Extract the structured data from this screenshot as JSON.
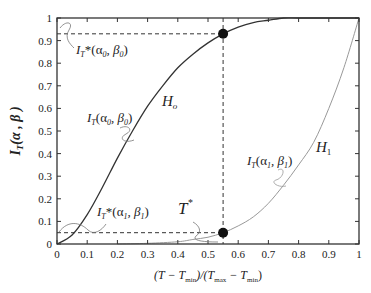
{
  "chart_data": {
    "type": "line",
    "title": "",
    "xlabel": "(T − T_min)/(T_max − T_min)",
    "ylabel": "I_T(α, β)",
    "xlim": [
      0,
      1
    ],
    "ylim": [
      0,
      1
    ],
    "grid": false,
    "legend": "none (inline annotations)",
    "x_ticks": [
      "0",
      "0.1",
      "0.2",
      "0.3",
      "0.4",
      "0.5",
      "0.6",
      "0.7",
      "0.8",
      "0.9",
      "1"
    ],
    "y_ticks": [
      "0",
      "0.1",
      "0.2",
      "0.3",
      "0.4",
      "0.5",
      "0.6",
      "0.7",
      "0.8",
      "0.9",
      "1"
    ],
    "series": [
      {
        "name": "H_o : I_T(α0, β0)",
        "color": "#333333",
        "x": [
          0,
          0.05,
          0.1,
          0.15,
          0.2,
          0.25,
          0.3,
          0.35,
          0.4,
          0.45,
          0.5,
          0.55,
          0.6,
          0.65,
          0.7,
          0.75,
          0.8,
          0.9,
          1.0
        ],
        "y": [
          0,
          0.04,
          0.13,
          0.25,
          0.38,
          0.5,
          0.61,
          0.7,
          0.78,
          0.84,
          0.89,
          0.93,
          0.96,
          0.98,
          0.99,
          1.0,
          1.0,
          1.0,
          1.0
        ]
      },
      {
        "name": "H_1 : I_T(α1, β1)",
        "color": "#999999",
        "x": [
          0.2,
          0.3,
          0.4,
          0.45,
          0.5,
          0.55,
          0.6,
          0.65,
          0.7,
          0.75,
          0.8,
          0.85,
          0.9,
          0.95,
          1.0
        ],
        "y": [
          0,
          0.003,
          0.01,
          0.02,
          0.03,
          0.05,
          0.08,
          0.12,
          0.18,
          0.26,
          0.35,
          0.45,
          0.6,
          0.78,
          1.0
        ]
      }
    ],
    "markers": [
      {
        "x": 0.55,
        "y": 0.93,
        "label": "I_T*(α0, β0)"
      },
      {
        "x": 0.55,
        "y": 0.05,
        "label": "I_T*(α1, β1)"
      }
    ],
    "reference_lines": [
      {
        "type": "horizontal",
        "y": 0.93,
        "x_to": 0.55,
        "style": "dashed"
      },
      {
        "type": "horizontal",
        "y": 0.05,
        "x_to": 0.55,
        "style": "dashed"
      },
      {
        "type": "vertical",
        "x": 0.55,
        "style": "dashed"
      }
    ],
    "annotations": [
      {
        "text": "I_T*(α0, β0)",
        "at": "y=0.93 left"
      },
      {
        "text": "I_T(α0, β0)",
        "at": "H_o curve"
      },
      {
        "text": "H_o",
        "at": "H_o curve near x=0.35"
      },
      {
        "text": "I_T*(α1, β1)",
        "at": "y=0.05 left"
      },
      {
        "text": "T*",
        "at": "x=0.55"
      },
      {
        "text": "I_T(α1, β1)",
        "at": "H_1 curve"
      },
      {
        "text": "H_1",
        "at": "H_1 curve near x=0.8"
      }
    ]
  },
  "labels": {
    "it_star_0_base": "I",
    "it_star_0_sub": "T",
    "it_star_0_args": "*(α",
    "it_star_0_a_sub": "0",
    "it_star_0_mid": ", β",
    "it_star_0_b_sub": "0",
    "it_star_0_close": ")",
    "it_0_base": "I",
    "it_0_sub": "T",
    "it_0_args": "(α",
    "it_0_a_sub": "0",
    "it_0_mid": ", β",
    "it_0_b_sub": "0",
    "it_0_close": ")",
    "h0_base": "H",
    "h0_sub": "o",
    "it_star_1_base": "I",
    "it_star_1_sub": "T",
    "it_star_1_args": "*(α",
    "it_star_1_a_sub": "1",
    "it_star_1_mid": ", β",
    "it_star_1_b_sub": "1",
    "it_star_1_close": ")",
    "tstar_base": "T",
    "tstar_sup": "*",
    "it_1_base": "I",
    "it_1_sub": "T",
    "it_1_args": "(α",
    "it_1_a_sub": "1",
    "it_1_mid": ", β",
    "it_1_b_sub": "1",
    "it_1_close": ")",
    "h1_base": "H",
    "h1_sub": "1",
    "ylabel_base": "I",
    "ylabel_sub": "T",
    "ylabel_args": "(α , β )",
    "xlabel_open": "(T − T",
    "xlabel_min1": "min",
    "xlabel_mid": ")/(T",
    "xlabel_max": "max",
    "xlabel_dash": " − T",
    "xlabel_min2": "min",
    "xlabel_close": ")"
  }
}
